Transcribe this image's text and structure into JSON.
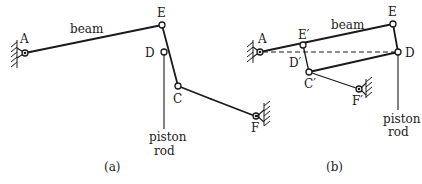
{
  "figure": {
    "panels": [
      {
        "id": "a",
        "caption": "(a)",
        "labels": {
          "A": "A",
          "E": "E",
          "D": "D",
          "C": "C",
          "F": "F",
          "beam": "beam",
          "piston": "piston",
          "rod": "rod"
        }
      },
      {
        "id": "b",
        "caption": "(b)",
        "labels": {
          "A": "A",
          "E": "E",
          "E_prime": "E′",
          "D": "D",
          "D_prime": "D′",
          "C_prime": "C′",
          "F_prime": "F′",
          "beam": "beam",
          "piston": "piston",
          "rod": "rod"
        }
      }
    ],
    "colors": {
      "ink": "#1a1a1a",
      "background": "#ffffff"
    }
  }
}
